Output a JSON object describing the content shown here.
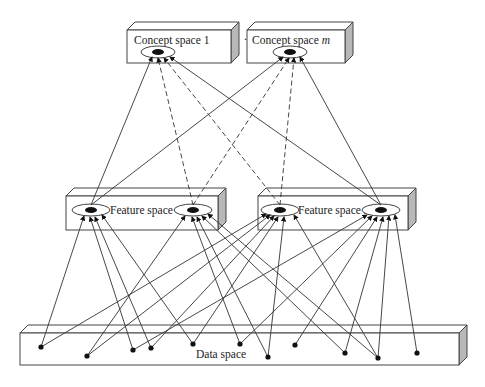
{
  "diagram": {
    "concept_spaces": [
      {
        "label": "Concept space 1",
        "label_main": "Concept space ",
        "label_var": "1"
      },
      {
        "label": "Concept space m",
        "label_main": "Concept space ",
        "label_var": "m"
      }
    ],
    "concept_separator": "......",
    "feature_spaces": [
      {
        "label": "Feature space 1",
        "label_main": "Feature space ",
        "label_var": "1"
      },
      {
        "label": "Feature space n",
        "label_main": "Feature space ",
        "label_var": "n"
      }
    ],
    "data_space": {
      "label": "Data space"
    },
    "colors": {
      "line": "#333333",
      "box_face": "#ffffff",
      "box_side": "#b8b8b8",
      "node": "#111111"
    },
    "legend_notes": {
      "solid_lines": "feature-to-concept / data-to-feature mappings",
      "dashed_lines": "feature-to-concept mappings"
    }
  }
}
